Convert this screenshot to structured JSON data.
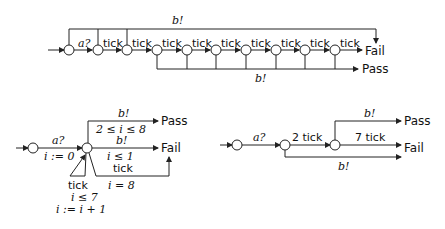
{
  "top": {
    "input_label": "a?",
    "tick_label": "tick",
    "top_bar_label": "b!",
    "bottom_bar_label": "b!",
    "fail": "Fail",
    "pass": "Pass"
  },
  "bottom_left": {
    "input_label": "a?",
    "input_update": "i := 0",
    "pass_label": "b!",
    "pass_guard": "2 ≤ i ≤ 8",
    "pass": "Pass",
    "fail_label": "b!",
    "fail_guard": "i ≤ 1",
    "fail": "Fail",
    "tick_fail_label": "tick",
    "tick_fail_guard": "i = 8",
    "loop_label": "tick",
    "loop_guard": "i ≤ 7",
    "loop_update": "i := i + 1"
  },
  "bottom_right": {
    "input_label": "a?",
    "two_tick": "2 tick",
    "seven_tick": "7 tick",
    "pass_label": "b!",
    "fail_label": "b!",
    "pass": "Pass",
    "fail": "Fail"
  }
}
